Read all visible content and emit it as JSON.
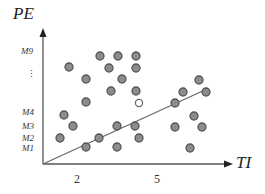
{
  "diagram": {
    "y_axis": {
      "title": "PE",
      "ticks": [
        "M9",
        "M4",
        "M3",
        "M2",
        "M1"
      ],
      "ellipsis": "⋮"
    },
    "x_axis": {
      "title": "TI",
      "ticks": [
        "2",
        "5"
      ]
    },
    "colors": {
      "dot_fill": "#8c8c8c",
      "dot_stroke": "#555555",
      "line": "#666666",
      "axis": "#555555",
      "hollow_stroke": "#666666"
    },
    "separator_line": {
      "x1": 43,
      "y1": 164,
      "x2": 207,
      "y2": 89
    },
    "dots": [
      {
        "x": 100,
        "y": 56
      },
      {
        "x": 118,
        "y": 56
      },
      {
        "x": 136,
        "y": 56
      },
      {
        "x": 69,
        "y": 67
      },
      {
        "x": 109,
        "y": 68
      },
      {
        "x": 136,
        "y": 68
      },
      {
        "x": 86,
        "y": 79
      },
      {
        "x": 122,
        "y": 79
      },
      {
        "x": 111,
        "y": 91
      },
      {
        "x": 136,
        "y": 91
      },
      {
        "x": 86,
        "y": 102
      },
      {
        "x": 64,
        "y": 115
      },
      {
        "x": 73,
        "y": 126
      },
      {
        "x": 60,
        "y": 138
      },
      {
        "x": 117,
        "y": 126
      },
      {
        "x": 135,
        "y": 126
      },
      {
        "x": 99,
        "y": 138
      },
      {
        "x": 139,
        "y": 138
      },
      {
        "x": 86,
        "y": 147
      },
      {
        "x": 117,
        "y": 147
      },
      {
        "x": 199,
        "y": 80
      },
      {
        "x": 183,
        "y": 92
      },
      {
        "x": 206,
        "y": 92
      },
      {
        "x": 175,
        "y": 103
      },
      {
        "x": 194,
        "y": 116
      },
      {
        "x": 175,
        "y": 127
      },
      {
        "x": 202,
        "y": 127
      },
      {
        "x": 190,
        "y": 148
      }
    ],
    "hollow_dots": [
      {
        "x": 139,
        "y": 103
      }
    ]
  }
}
